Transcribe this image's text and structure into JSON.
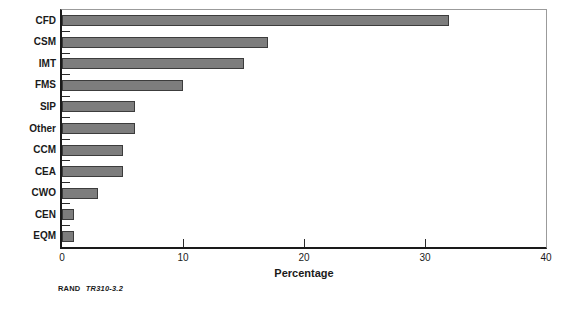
{
  "chart_data": {
    "type": "bar",
    "orientation": "horizontal",
    "categories": [
      "CFD",
      "CSM",
      "IMT",
      "FMS",
      "SIP",
      "Other",
      "CCM",
      "CEA",
      "CWO",
      "CEN",
      "EQM"
    ],
    "values": [
      32,
      17,
      15,
      10,
      6,
      6,
      5,
      5,
      3,
      1,
      1
    ],
    "xlabel": "Percentage",
    "xlim": [
      0,
      40
    ],
    "xticks": [
      0,
      10,
      20,
      30,
      40
    ],
    "inner_xticks": [
      10,
      20,
      30
    ],
    "grid": false,
    "legend": "none",
    "bar_color": "#7d7d7d",
    "bar_border_color": "#3c3c3c",
    "axis_color": "#1a1a1a",
    "frame_color": "#9b9b9b"
  },
  "caption": {
    "publisher": "RAND",
    "figure_number": "TR310-3.2"
  }
}
